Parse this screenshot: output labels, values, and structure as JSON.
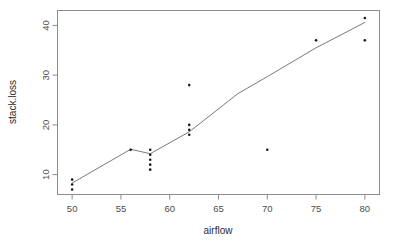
{
  "chart_data": {
    "type": "scatter",
    "title": "",
    "subtitle": "",
    "xlabel": "airflow",
    "ylabel": "stack.loss",
    "xlim": [
      48.5,
      81.5
    ],
    "ylim": [
      6,
      43
    ],
    "xticks": [
      50,
      55,
      60,
      65,
      70,
      75,
      80
    ],
    "xtick_labels": [
      "50",
      "55",
      "60",
      "65",
      "70",
      "75",
      "80"
    ],
    "yticks": [
      10,
      20,
      30,
      40
    ],
    "ytick_labels": [
      "10",
      "20",
      "30",
      "40"
    ],
    "grid": false,
    "legend": null,
    "points": [
      {
        "x": 50,
        "y": 7
      },
      {
        "x": 50,
        "y": 8
      },
      {
        "x": 50,
        "y": 9
      },
      {
        "x": 56,
        "y": 15
      },
      {
        "x": 58,
        "y": 11
      },
      {
        "x": 58,
        "y": 12
      },
      {
        "x": 58,
        "y": 13
      },
      {
        "x": 58,
        "y": 14
      },
      {
        "x": 58,
        "y": 15
      },
      {
        "x": 62,
        "y": 18
      },
      {
        "x": 62,
        "y": 19
      },
      {
        "x": 62,
        "y": 20
      },
      {
        "x": 62,
        "y": 28
      },
      {
        "x": 70,
        "y": 15
      },
      {
        "x": 75,
        "y": 37
      },
      {
        "x": 80,
        "y": 37
      },
      {
        "x": 80,
        "y": 41.5
      }
    ],
    "series": [
      {
        "name": "fitted",
        "type": "line",
        "x": [
          50,
          56,
          58,
          62,
          67,
          70,
          75,
          80
        ],
        "values": [
          8.3,
          15.1,
          14.2,
          18.6,
          26.3,
          29.7,
          35.5,
          40.6
        ]
      }
    ]
  }
}
